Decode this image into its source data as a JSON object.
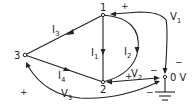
{
  "diagram": {
    "type": "circuit-node-diagram",
    "colors": {
      "line": "#222222",
      "background": "#ffffff"
    },
    "nodes": [
      {
        "id": "1",
        "label": "1"
      },
      {
        "id": "2",
        "label": "2"
      },
      {
        "id": "3",
        "label": "3"
      },
      {
        "id": "ref",
        "label": "0 V"
      }
    ],
    "currents": [
      {
        "name": "I",
        "sub": "1",
        "from": "1",
        "to": "2"
      },
      {
        "name": "I",
        "sub": "2",
        "from": "1",
        "to": "2"
      },
      {
        "name": "I",
        "sub": "3",
        "from": "1",
        "to": "3"
      },
      {
        "name": "I",
        "sub": "4",
        "from": "3",
        "to": "2"
      }
    ],
    "voltages": [
      {
        "name": "V",
        "sub": "1",
        "plus": "+",
        "minus": "−",
        "positive_node": "1",
        "negative_node": "ref"
      },
      {
        "name": "V",
        "sub": "2",
        "plus": "+",
        "minus": "−",
        "positive_node": "2",
        "negative_node": "ref"
      },
      {
        "name": "V",
        "sub": "3",
        "plus": "+",
        "minus": "−",
        "positive_node": "3",
        "negative_node": "ref"
      }
    ],
    "ground_icon": "ground-icon"
  }
}
